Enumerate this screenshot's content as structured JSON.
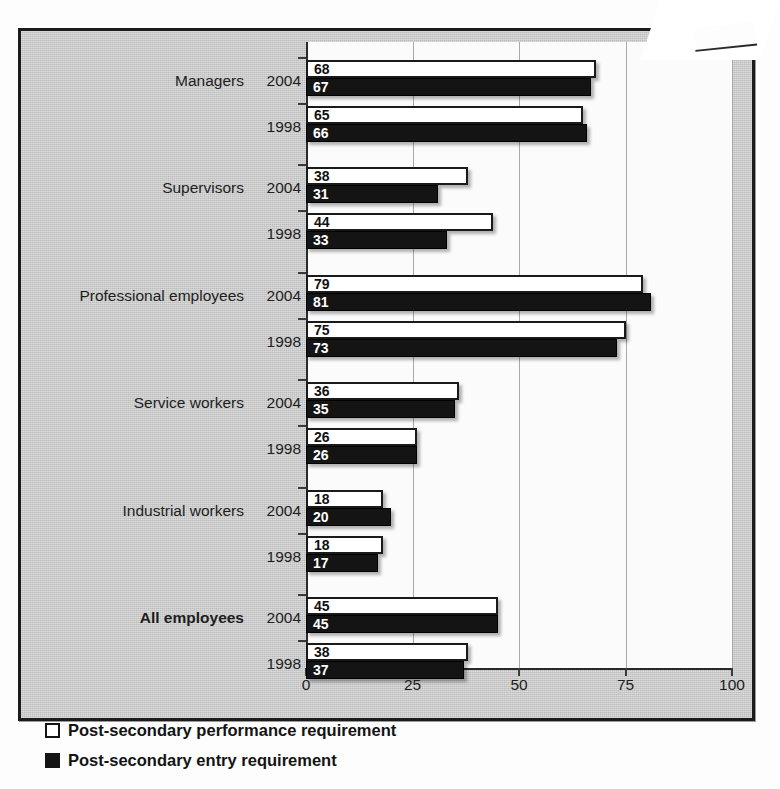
{
  "figure": {
    "background_color": "#c8c8c8",
    "frame_color": "#1b1b1b",
    "plot_background": "#fbfbfb"
  },
  "chart_data": {
    "type": "bar",
    "orientation": "horizontal",
    "title": "",
    "subtitle": "",
    "xlabel": "",
    "ylabel": "",
    "xlim": [
      0,
      100
    ],
    "xticks": [
      "0",
      "25",
      "50",
      "75",
      "100"
    ],
    "xtick_values": [
      0,
      25,
      50,
      75,
      100
    ],
    "grid": true,
    "grid_axis": "x",
    "legend_position": "bottom-left",
    "series": [
      {
        "name": "Post-secondary performance requirement",
        "style": "open",
        "color": "#ffffff",
        "edge_color": "#1a1a1a",
        "values": [
          68,
          65,
          38,
          44,
          79,
          75,
          36,
          26,
          18,
          18,
          45,
          38
        ]
      },
      {
        "name": "Post-secondary entry requirement",
        "style": "solid",
        "color": "#141414",
        "edge_color": "#000000",
        "values": [
          67,
          66,
          31,
          33,
          81,
          73,
          35,
          26,
          20,
          17,
          45,
          37
        ]
      }
    ],
    "groups": [
      {
        "category": "Managers",
        "bold": false,
        "rows": [
          {
            "year": "2004",
            "performance": 68,
            "entry": 67
          },
          {
            "year": "1998",
            "performance": 65,
            "entry": 66
          }
        ]
      },
      {
        "category": "Supervisors",
        "bold": false,
        "rows": [
          {
            "year": "2004",
            "performance": 38,
            "entry": 31
          },
          {
            "year": "1998",
            "performance": 44,
            "entry": 33
          }
        ]
      },
      {
        "category": "Professional employees",
        "bold": false,
        "rows": [
          {
            "year": "2004",
            "performance": 79,
            "entry": 81
          },
          {
            "year": "1998",
            "performance": 75,
            "entry": 73
          }
        ]
      },
      {
        "category": "Service workers",
        "bold": false,
        "rows": [
          {
            "year": "2004",
            "performance": 36,
            "entry": 35
          },
          {
            "year": "1998",
            "performance": 26,
            "entry": 26
          }
        ]
      },
      {
        "category": "Industrial workers",
        "bold": false,
        "rows": [
          {
            "year": "2004",
            "performance": 18,
            "entry": 20
          },
          {
            "year": "1998",
            "performance": 18,
            "entry": 17
          }
        ]
      },
      {
        "category": "All employees",
        "bold": true,
        "rows": [
          {
            "year": "2004",
            "performance": 45,
            "entry": 45
          },
          {
            "year": "1998",
            "performance": 38,
            "entry": 37
          }
        ]
      }
    ]
  },
  "legend": {
    "items": [
      {
        "style": "open",
        "label": "Post-secondary performance requirement"
      },
      {
        "style": "solid",
        "label": "Post-secondary entry requirement"
      }
    ]
  }
}
